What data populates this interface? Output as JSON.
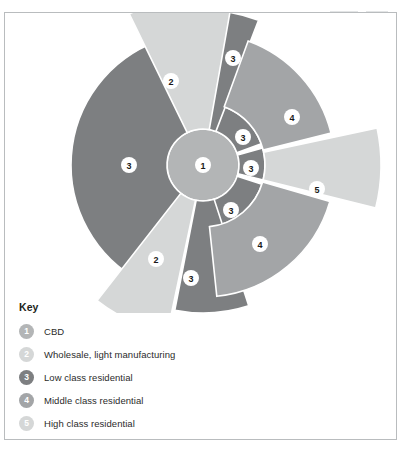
{
  "figure": {
    "legend_title": "Key"
  },
  "legend": {
    "items": [
      {
        "id": "1",
        "label": "CBD",
        "color": "#b3b5b6"
      },
      {
        "id": "2",
        "label": "Wholesale, light manufacturing",
        "color": "#d5d7d7"
      },
      {
        "id": "3",
        "label": "Low class residential",
        "color": "#7d7f81"
      },
      {
        "id": "4",
        "label": "Middle class residential",
        "color": "#a3a5a7"
      },
      {
        "id": "5",
        "label": "High class residential",
        "color": "#d5d7d7"
      }
    ]
  },
  "chart_data": {
    "type": "pie",
    "xlabel": "",
    "ylabel": "",
    "legend_position": "bottom-left",
    "grid": false,
    "center": {
      "cx": 198,
      "cy": 152,
      "r_core": 36,
      "r_inner_ring": 62,
      "r_outer": 132
    },
    "categories": [
      "CBD",
      "Wholesale, light manufacturing",
      "Low class residential",
      "Middle class residential",
      "High class residential"
    ],
    "values": [
      1,
      2,
      3,
      4,
      5
    ],
    "zone_colors": {
      "cbd": "#b3b5b6",
      "wholesale": "#d5d7d7",
      "low_class": "#7d7f81",
      "middle_class": "#a3a5a7",
      "high_class": "#d5d7d7"
    },
    "sectors": [
      {
        "key": "1",
        "name": "cbd-core",
        "zone": "CBD",
        "label": "1",
        "fill": "#b3b5b6",
        "shape": "circle",
        "r": 36,
        "label_x": 198,
        "label_y": 152
      },
      {
        "key": "3",
        "name": "low-class-inner-upper-right",
        "zone": "Low class residential",
        "label": "3",
        "fill": "#7d7f81",
        "shape": "annulus",
        "r0": 36,
        "r1": 62,
        "a0": -72,
        "a1": -20,
        "label_x": 238,
        "label_y": 124
      },
      {
        "key": "3",
        "name": "low-class-inner-right",
        "zone": "Low class residential",
        "label": "3",
        "fill": "#7d7f81",
        "shape": "annulus",
        "r0": 36,
        "r1": 62,
        "a0": -16,
        "a1": 14,
        "label_x": 246,
        "label_y": 155
      },
      {
        "key": "3",
        "name": "low-class-inner-lower-right",
        "zone": "Low class residential",
        "label": "3",
        "fill": "#7d7f81",
        "shape": "annulus",
        "r0": 36,
        "r1": 62,
        "a0": 18,
        "a1": 82,
        "label_x": 226,
        "label_y": 197
      },
      {
        "key": "3",
        "name": "low-class-west-sector",
        "zone": "Low class residential",
        "label": "3",
        "fill": "#7d7f81",
        "shape": "wedge",
        "r0": 36,
        "r1": 132,
        "a0": 118,
        "a1": 250,
        "label_x": 124,
        "label_y": 152
      },
      {
        "key": "3",
        "name": "low-class-north-sector",
        "zone": "Low class residential",
        "label": "3",
        "fill": "#7d7f81",
        "shape": "wedge",
        "r0": 36,
        "r1": 155,
        "a0": -90,
        "a1": -69,
        "label_x": 228,
        "label_y": 45
      },
      {
        "key": "3",
        "name": "low-class-south-sector",
        "zone": "Low class residential",
        "label": "3",
        "fill": "#7d7f81",
        "shape": "wedge",
        "r0": 36,
        "r1": 148,
        "a0": 72,
        "a1": 101,
        "label_x": 186,
        "label_y": 265
      },
      {
        "key": "2",
        "name": "wholesale-northwest-sector",
        "zone": "Wholesale, light manufacturing",
        "label": "2",
        "fill": "#d5d7d7",
        "shape": "wedge",
        "r0": 36,
        "r1": 168,
        "a0": -116,
        "a1": -80,
        "label_x": 166,
        "label_y": 68
      },
      {
        "key": "2",
        "name": "wholesale-southwest-sector",
        "zone": "Wholesale, light manufacturing",
        "label": "2",
        "fill": "#d5d7d7",
        "shape": "wedge",
        "r0": 36,
        "r1": 172,
        "a0": 102,
        "a1": 128,
        "label_x": 151,
        "label_y": 246
      },
      {
        "key": "4",
        "name": "middle-class-northeast-sector",
        "zone": "Middle class residential",
        "label": "4",
        "fill": "#a3a5a7",
        "shape": "wedge",
        "r0": 62,
        "r1": 132,
        "a0": -70,
        "a1": -14,
        "label_x": 287,
        "label_y": 104
      },
      {
        "key": "4",
        "name": "middle-class-southeast-sector",
        "zone": "Middle class residential",
        "label": "4",
        "fill": "#a3a5a7",
        "shape": "wedge",
        "r0": 62,
        "r1": 132,
        "a0": 16,
        "a1": 84,
        "label_x": 255,
        "label_y": 231
      },
      {
        "key": "5",
        "name": "high-class-east-sector",
        "zone": "High class residential",
        "label": "5",
        "fill": "#d5d7d7",
        "shape": "wedge",
        "r0": 62,
        "r1": 178,
        "a0": -12,
        "a1": 14,
        "label_x": 312,
        "label_y": 176
      }
    ],
    "markers": [
      {
        "label": "1",
        "x": 198,
        "y": 152
      },
      {
        "label": "2",
        "x": 166,
        "y": 68
      },
      {
        "label": "2",
        "x": 151,
        "y": 246
      },
      {
        "label": "3",
        "x": 124,
        "y": 152
      },
      {
        "label": "3",
        "x": 228,
        "y": 45
      },
      {
        "label": "3",
        "x": 186,
        "y": 265
      },
      {
        "label": "3",
        "x": 238,
        "y": 124
      },
      {
        "label": "3",
        "x": 246,
        "y": 155
      },
      {
        "label": "3",
        "x": 226,
        "y": 197
      },
      {
        "label": "4",
        "x": 287,
        "y": 104
      },
      {
        "label": "4",
        "x": 255,
        "y": 231
      },
      {
        "label": "5",
        "x": 312,
        "y": 176
      }
    ]
  }
}
